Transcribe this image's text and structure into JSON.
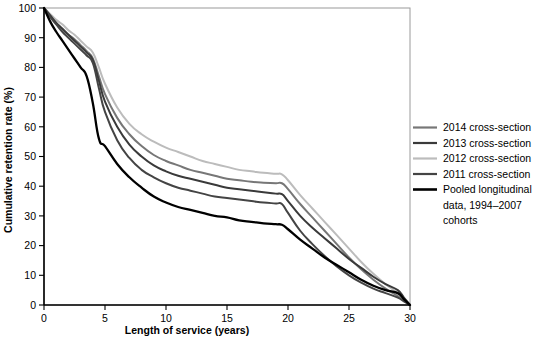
{
  "chart_data": {
    "type": "line",
    "title": "",
    "xlabel": "Length of service (years)",
    "ylabel": "Cumulative retention rate (%)",
    "xlim": [
      0,
      30
    ],
    "ylim": [
      0,
      100
    ],
    "xticks": [
      0,
      5,
      10,
      15,
      20,
      25,
      30
    ],
    "yticks": [
      0,
      10,
      20,
      30,
      40,
      50,
      60,
      70,
      80,
      90,
      100
    ],
    "grid": false,
    "legend_position": "right",
    "series": [
      {
        "name": "2014 cross-section",
        "color": "#777777",
        "x": [
          0,
          0.5,
          1,
          1.5,
          2,
          2.5,
          3,
          3.5,
          4,
          4.5,
          5,
          6,
          7,
          8,
          9,
          10,
          11,
          12,
          13,
          14,
          15,
          16,
          17,
          18,
          19,
          19.5,
          20,
          21,
          22,
          23,
          24,
          25,
          26,
          27,
          28,
          29,
          29.5,
          30
        ],
        "y": [
          100,
          97.5,
          95,
          93,
          91,
          89.5,
          87.5,
          85.5,
          83,
          77,
          71,
          63,
          57.5,
          53.5,
          50.5,
          48.5,
          47,
          45.5,
          44.5,
          43.5,
          42.5,
          42,
          41.5,
          41.2,
          41,
          41,
          39,
          34,
          29.5,
          25,
          20.5,
          16,
          12,
          8.5,
          5.5,
          3,
          1.5,
          0
        ]
      },
      {
        "name": "2013 cross-section",
        "color": "#3a3a3a",
        "x": [
          0,
          0.5,
          1,
          1.5,
          2,
          2.5,
          3,
          3.5,
          4,
          4.5,
          5,
          6,
          7,
          8,
          9,
          10,
          11,
          12,
          13,
          14,
          15,
          16,
          17,
          18,
          19,
          19.5,
          20,
          21,
          22,
          23,
          24,
          25,
          26,
          27,
          28,
          29,
          29.5,
          30
        ],
        "y": [
          100,
          97.5,
          95,
          93,
          91,
          89,
          87,
          85,
          82.5,
          75.5,
          68.5,
          60,
          54,
          50,
          47,
          45,
          43.5,
          42.5,
          41.5,
          40.5,
          39.5,
          39,
          38.5,
          38,
          37.5,
          37.3,
          35,
          30,
          26,
          22.5,
          19,
          15.5,
          12.5,
          9.5,
          7,
          5,
          2.5,
          0
        ]
      },
      {
        "name": "2012 cross-section",
        "color": "#bcbcbc",
        "x": [
          0,
          0.5,
          1,
          1.5,
          2,
          2.5,
          3,
          3.5,
          4,
          4.5,
          5,
          6,
          7,
          8,
          9,
          10,
          11,
          12,
          13,
          14,
          15,
          16,
          17,
          18,
          19,
          19.5,
          20,
          21,
          22,
          23,
          24,
          25,
          26,
          27,
          28,
          29,
          29.5,
          30
        ],
        "y": [
          100,
          98,
          96,
          94.5,
          92.5,
          91,
          89,
          87,
          85,
          80,
          74.5,
          66.5,
          61,
          57.5,
          55,
          53,
          51.5,
          50,
          48.5,
          47.5,
          46.5,
          45.5,
          45,
          44.5,
          44.2,
          44,
          42,
          37,
          32.5,
          28,
          23.5,
          19,
          14.5,
          10.5,
          7,
          4,
          2,
          0
        ]
      },
      {
        "name": "2011 cross-section",
        "color": "#444444",
        "x": [
          0,
          0.5,
          1,
          1.5,
          2,
          2.5,
          3,
          3.5,
          4,
          4.5,
          5,
          6,
          7,
          8,
          9,
          10,
          11,
          12,
          13,
          14,
          15,
          16,
          17,
          18,
          19,
          19.5,
          20,
          21,
          22,
          23,
          24,
          25,
          26,
          27,
          28,
          29,
          29.5,
          30
        ],
        "y": [
          100,
          97,
          94.5,
          92,
          90,
          88,
          86,
          84,
          81.5,
          73,
          65,
          55.5,
          49.5,
          45.5,
          43,
          41,
          39.5,
          38.5,
          37.5,
          36.5,
          36,
          35.5,
          35,
          34.5,
          34.2,
          34,
          31,
          25,
          20.5,
          16.5,
          13,
          10,
          7.5,
          5.5,
          4,
          2.5,
          1.2,
          0
        ]
      },
      {
        "name": "Pooled longitudinal data, 1994–2007 cohorts",
        "color": "#000000",
        "x": [
          0,
          0.5,
          1,
          1.5,
          2,
          2.5,
          3,
          3.5,
          4,
          4.5,
          5,
          6,
          7,
          8,
          9,
          10,
          11,
          12,
          13,
          14,
          15,
          16,
          17,
          18,
          19,
          19.5,
          20,
          21,
          22,
          23,
          24,
          25,
          26,
          27,
          28,
          29,
          29.5,
          30
        ],
        "y": [
          100,
          95.5,
          92,
          89,
          86,
          83,
          80,
          77,
          68,
          56,
          53.5,
          47.5,
          43,
          39.5,
          36.5,
          34.5,
          33,
          32,
          31,
          30,
          29.5,
          28.5,
          28,
          27.5,
          27.2,
          27,
          25.5,
          22,
          19,
          16,
          13.5,
          11,
          8.5,
          6.5,
          5,
          4,
          2,
          0
        ]
      }
    ]
  },
  "legend": {
    "items": [
      {
        "label": "2014 cross-section",
        "color": "#777777"
      },
      {
        "label": "2013 cross-section",
        "color": "#3a3a3a"
      },
      {
        "label": "2012 cross-section",
        "color": "#bcbcbc"
      },
      {
        "label": "2011 cross-section",
        "color": "#444444"
      },
      {
        "label": "Pooled longitudinal",
        "color": "#000000"
      },
      {
        "label": "data, 1994–2007",
        "color": ""
      },
      {
        "label": "cohorts",
        "color": ""
      }
    ]
  },
  "axes": {
    "x_tick_labels": [
      "0",
      "5",
      "10",
      "15",
      "20",
      "25",
      "30"
    ],
    "y_tick_labels": [
      "0",
      "10",
      "20",
      "30",
      "40",
      "50",
      "60",
      "70",
      "80",
      "90",
      "100"
    ],
    "x_title": "Length of service (years)",
    "y_title": "Cumulative retention rate (%)"
  }
}
